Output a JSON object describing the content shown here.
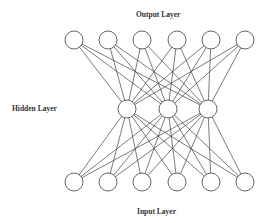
{
  "labels": {
    "output": "Output Layer",
    "hidden": "Hidden Layer",
    "input": "Input Layer"
  },
  "style": {
    "line_color": "#444444",
    "node_stroke": "#555555",
    "node_fill": "#ffffff",
    "background": "#ffffff"
  },
  "layers": {
    "output": {
      "y": 40,
      "x": [
        74,
        108,
        142,
        177,
        211,
        245
      ],
      "node_count": 6
    },
    "hidden": {
      "y": 109,
      "x": [
        127,
        168,
        208
      ],
      "node_count": 3
    },
    "input": {
      "y": 182,
      "x": [
        74,
        108,
        142,
        177,
        211,
        245
      ],
      "node_count": 6
    }
  },
  "node_radius": 9,
  "connectivity": "fully-connected"
}
